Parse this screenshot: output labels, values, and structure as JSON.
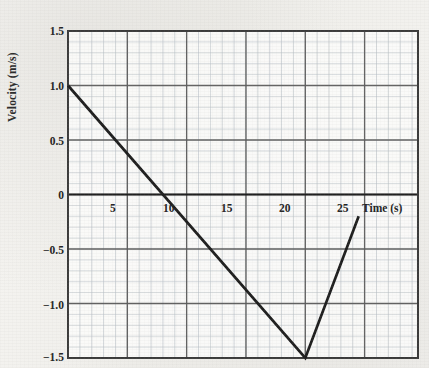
{
  "chart_data": {
    "type": "line",
    "title": "",
    "xlabel": "Time (s)",
    "ylabel": "Velocity (m/s)",
    "xlim": [
      0,
      29.5
    ],
    "ylim": [
      -1.5,
      1.5
    ],
    "grid": true,
    "grid_minor": true,
    "legend": "none",
    "x_ticks": [
      5,
      10,
      15,
      20,
      25
    ],
    "x_tick_labels": [
      "5",
      "10",
      "15",
      "20",
      "25"
    ],
    "y_ticks": [
      1.5,
      1.0,
      0.5,
      0,
      -0.5,
      -1.0,
      -1.5
    ],
    "y_tick_labels": [
      "1.5",
      "1.0",
      "0.5",
      "0",
      "−0.5",
      "−1.0",
      "−1.5"
    ],
    "series": [
      {
        "name": "velocity",
        "color": "#1e1e1e",
        "x": [
          0,
          20,
          24.5
        ],
        "values": [
          1.0,
          -1.5,
          -0.2
        ]
      }
    ],
    "annotations": [
      {
        "label": "zero crossing",
        "x": 8.6,
        "y": 0
      },
      {
        "label": "minimum",
        "x": 20,
        "y": -1.5
      }
    ]
  },
  "axes": {
    "x_axis_label": "Time (s)",
    "y_axis_label": "Velocity (m/s)"
  },
  "colors": {
    "line": "#1e1e1e",
    "major_grid": "#5b5b5b",
    "minor_grid": "#b9c0c6",
    "border": "#3a3a3a",
    "text": "#232323",
    "page_background": "#f3f2ef"
  }
}
